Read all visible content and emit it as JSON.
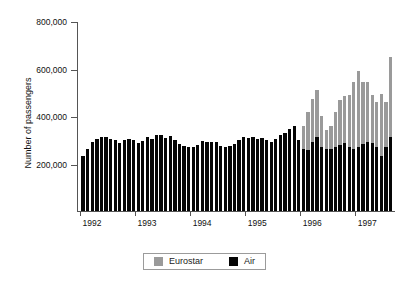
{
  "chart_data": {
    "type": "bar",
    "stacked": true,
    "title": "",
    "xlabel": "",
    "ylabel": "Number of passengers",
    "ylim": [
      0,
      800000
    ],
    "yticks": [
      0,
      200000,
      400000,
      600000,
      800000
    ],
    "ytick_labels": [
      "",
      "200,000",
      "400,000",
      "600,000",
      "800,000"
    ],
    "xtick_labels": [
      "1992",
      "1993",
      "1994",
      "1995",
      "1996",
      "1997"
    ],
    "grid": false,
    "legend_position": "bottom",
    "x_start_label": "1992",
    "x_end_label": "1997",
    "series": [
      {
        "name": "Air",
        "color": "#050505",
        "values": [
          230000,
          262000,
          290000,
          305000,
          312000,
          310000,
          305000,
          300000,
          288000,
          300000,
          305000,
          300000,
          285000,
          295000,
          312000,
          305000,
          318000,
          318000,
          308000,
          315000,
          300000,
          282000,
          272000,
          268000,
          270000,
          278000,
          295000,
          290000,
          290000,
          292000,
          272000,
          268000,
          272000,
          282000,
          300000,
          310000,
          308000,
          312000,
          305000,
          308000,
          300000,
          292000,
          305000,
          318000,
          330000,
          345000,
          360000,
          298000,
          262000,
          258000,
          290000,
          310000,
          268000,
          262000,
          262000,
          268000,
          278000,
          285000,
          268000,
          262000,
          270000,
          282000,
          292000,
          288000,
          268000,
          232000,
          268000,
          310000
        ]
      },
      {
        "name": "Eurostar",
        "color": "#9a9a9a",
        "values": [
          0,
          0,
          0,
          0,
          0,
          0,
          0,
          0,
          0,
          0,
          0,
          0,
          0,
          0,
          0,
          0,
          0,
          0,
          0,
          0,
          0,
          0,
          0,
          0,
          0,
          0,
          0,
          0,
          0,
          0,
          0,
          0,
          0,
          0,
          0,
          0,
          0,
          0,
          0,
          0,
          0,
          0,
          0,
          0,
          0,
          0,
          0,
          0,
          95000,
          160000,
          180000,
          200000,
          130000,
          78000,
          98000,
          150000,
          190000,
          200000,
          220000,
          280000,
          320000,
          260000,
          250000,
          200000,
          190000,
          262000,
          192000,
          340000
        ]
      }
    ]
  },
  "legend": {
    "items": [
      {
        "label": "Eurostar",
        "swatch": "eurostar-swatch"
      },
      {
        "label": "Air",
        "swatch": "air-swatch"
      }
    ]
  }
}
